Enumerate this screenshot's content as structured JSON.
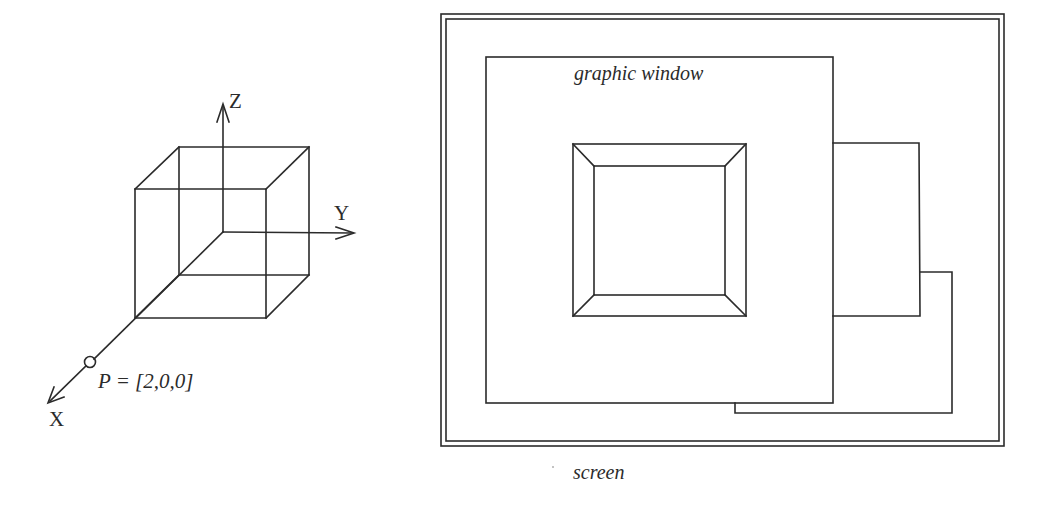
{
  "left_figure": {
    "name": "3D coordinate system with cube",
    "axes": {
      "x_label": "X",
      "y_label": "Y",
      "z_label": "Z"
    },
    "point": {
      "label": "P = [2,0,0]",
      "coordinates": [
        2,
        0,
        0
      ]
    }
  },
  "right_figure": {
    "name": "Screen with overlapping windows",
    "screen_label": "screen",
    "window_label": "graphic window",
    "window_count": 3,
    "content": "square frustum (truncated pyramid) viewed from above"
  },
  "colors": {
    "ink": "#2b2b2b",
    "background": "#ffffff"
  }
}
